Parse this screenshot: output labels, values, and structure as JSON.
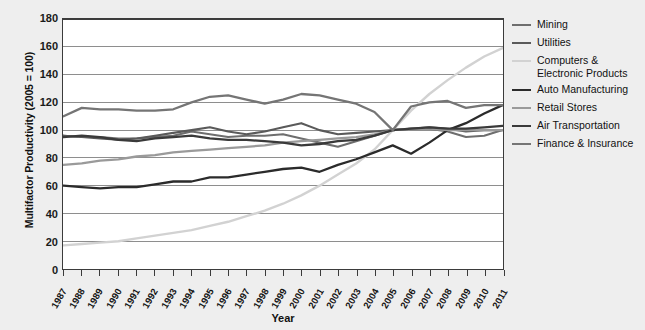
{
  "chart_data": {
    "type": "line",
    "title": "",
    "xlabel": "Year",
    "ylabel": "Multifactor Productivity (2005 = 100)",
    "ylim": [
      0,
      180
    ],
    "ytick_step": 20,
    "grid": true,
    "legend_position": "right",
    "background": "#eeeeee",
    "plot_background": "#ffffff",
    "categories": [
      "1987",
      "1988",
      "1989",
      "1990",
      "1991",
      "1992",
      "1993",
      "1994",
      "1995",
      "1996",
      "1997",
      "1998",
      "1999",
      "2000",
      "2001",
      "2002",
      "2003",
      "2004",
      "2005",
      "2006",
      "2007",
      "2008",
      "2009",
      "2010",
      "2011"
    ],
    "yticks": [
      "0",
      "20",
      "40",
      "60",
      "80",
      "100",
      "120",
      "140",
      "160",
      "180"
    ],
    "series": [
      {
        "name": "Mining",
        "color": "#6e6e6e",
        "width": 2.1,
        "values": [
          96,
          95,
          95,
          94,
          94,
          95,
          96,
          99,
          97,
          95,
          96,
          96,
          97,
          94,
          91,
          88,
          92,
          96,
          100,
          101,
          101,
          99,
          95,
          96,
          100
        ]
      },
      {
        "name": "Utilities",
        "color": "#5a5a5a",
        "width": 2.1,
        "values": [
          96,
          95,
          94,
          93,
          94,
          96,
          98,
          100,
          102,
          99,
          97,
          99,
          102,
          105,
          100,
          97,
          98,
          99,
          100,
          101,
          102,
          101,
          99,
          100,
          100
        ]
      },
      {
        "name": "Computers & Electronic Products",
        "color": "#d2d2d2",
        "width": 2.4,
        "values": [
          17,
          18,
          19,
          20,
          22,
          24,
          26,
          28,
          31,
          34,
          38,
          42,
          47,
          53,
          60,
          68,
          76,
          86,
          100,
          114,
          126,
          136,
          145,
          153,
          159
        ]
      },
      {
        "name": "Auto Manufacturing",
        "color": "#2b2b2b",
        "width": 2.3,
        "values": [
          60,
          59,
          58,
          59,
          59,
          61,
          63,
          63,
          66,
          66,
          68,
          70,
          72,
          73,
          70,
          75,
          79,
          84,
          89,
          83,
          91,
          100,
          105,
          112,
          118
        ]
      },
      {
        "name": "Retail Stores",
        "color": "#9a9a9a",
        "width": 2.3,
        "values": [
          75,
          76,
          78,
          79,
          81,
          82,
          84,
          85,
          86,
          87,
          88,
          89,
          91,
          92,
          93,
          94,
          95,
          97,
          100,
          101,
          101,
          100,
          100,
          100,
          100
        ]
      },
      {
        "name": "Air Transportation",
        "color": "#3a3a3a",
        "width": 2.3,
        "values": [
          95,
          96,
          95,
          93,
          92,
          94,
          95,
          96,
          94,
          93,
          93,
          92,
          91,
          89,
          90,
          92,
          93,
          96,
          100,
          101,
          102,
          101,
          101,
          102,
          103
        ]
      },
      {
        "name": "Finance & Insurance",
        "color": "#757575",
        "width": 2.3,
        "values": [
          110,
          116,
          115,
          115,
          114,
          114,
          115,
          120,
          124,
          125,
          122,
          119,
          122,
          126,
          125,
          122,
          119,
          113,
          100,
          117,
          120,
          121,
          116,
          118,
          118
        ]
      }
    ]
  },
  "axis": {
    "x_title": "Year",
    "y_title": "Multifactor Productivity (2005 = 100)"
  },
  "legend": {
    "items": [
      {
        "label": "Mining"
      },
      {
        "label": "Utilities"
      },
      {
        "label": "Computers & Electronic Products"
      },
      {
        "label": "Auto Manufacturing"
      },
      {
        "label": "Retail Stores"
      },
      {
        "label": "Air Transportation"
      },
      {
        "label": "Finance & Insurance"
      }
    ]
  }
}
